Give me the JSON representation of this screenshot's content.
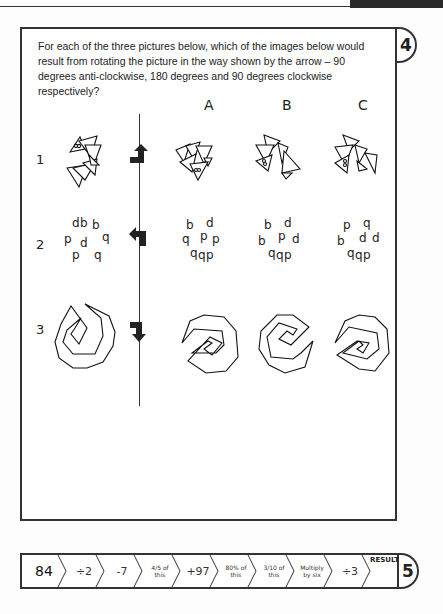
{
  "page": {
    "question_number": "4",
    "question_text": "For each of the three pictures below, which of the images below would result from rotating the picture in the way shown by the arrow – 90 degrees anti-clockwise, 180 degrees and 90 degrees clockwise respectively?",
    "columns": [
      "A",
      "B",
      "C"
    ],
    "rows": [
      {
        "number": "1",
        "rotation": "90 degrees anti-clockwise",
        "arrow_icon": "rotate-anticlockwise-arrow-icon",
        "figure": "triangle-cluster"
      },
      {
        "number": "2",
        "rotation": "180 degrees",
        "arrow_icon": "rotate-180-arrow-icon",
        "figure": "letter-cluster",
        "source_letters": [
          "d",
          "b",
          "b",
          "p",
          "d",
          "q",
          "p",
          "q"
        ],
        "options": {
          "A": [
            "b",
            "d",
            "q",
            "p",
            "p",
            "q",
            "q",
            "p"
          ],
          "B": [
            "b",
            "d",
            "b",
            "p",
            "d",
            "q",
            "q",
            "p"
          ],
          "C": [
            "p",
            "q",
            "b",
            "d",
            "d",
            "q",
            "q",
            "p"
          ]
        }
      },
      {
        "number": "3",
        "rotation": "90 degrees clockwise",
        "arrow_icon": "rotate-clockwise-arrow-icon",
        "figure": "spiral-polygon"
      }
    ]
  },
  "chain": {
    "start": "84",
    "steps": [
      "÷2",
      "-7",
      "4/5 of this",
      "+97",
      "80% of this",
      "3/10 of this",
      "Multiply by six",
      "÷3"
    ],
    "result_label": "RESULT",
    "result_value": "",
    "puzzle_number": "5"
  }
}
